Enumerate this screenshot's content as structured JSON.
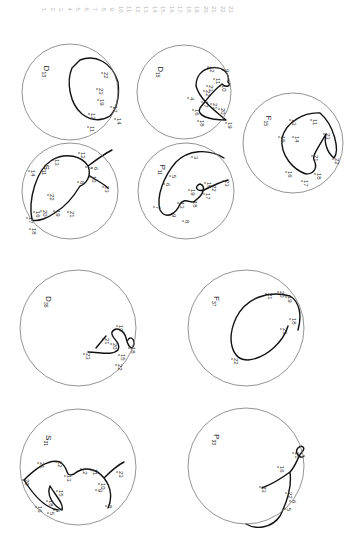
{
  "hour_list": [
    "1.",
    "2.",
    "3.",
    "4.",
    "5.",
    "6.",
    "7.",
    "8.",
    "9.",
    "10.",
    "11.",
    "12.",
    "13.",
    "14.",
    "15.",
    "16.",
    "17.",
    "18.",
    "19.",
    "20.",
    "21.",
    "22.",
    "23."
  ],
  "plots": [
    {
      "id": "D13",
      "letter": "D",
      "sub": "13",
      "cx": 70,
      "cy": 92,
      "r": 48,
      "labels": [
        {
          "t": "11",
          "x": 90,
          "y": 126
        },
        {
          "t": "12",
          "x": 91,
          "y": 113
        },
        {
          "t": "14",
          "x": 117,
          "y": 118
        },
        {
          "t": "17",
          "x": 113,
          "y": 106
        },
        {
          "t": "19",
          "x": 100,
          "y": 99
        },
        {
          "t": "22",
          "x": 104,
          "y": 72
        },
        {
          "t": "23",
          "x": 99,
          "y": 88
        }
      ]
    },
    {
      "id": "D15",
      "letter": "D",
      "sub": "15",
      "cx": 184,
      "cy": 92,
      "r": 47,
      "labels": [
        {
          "t": "4",
          "x": 190,
          "y": 97
        },
        {
          "t": "9",
          "x": 225,
          "y": 69
        },
        {
          "t": "10",
          "x": 222,
          "y": 85
        },
        {
          "t": "11",
          "x": 216,
          "y": 78
        },
        {
          "t": "12",
          "x": 210,
          "y": 66
        },
        {
          "t": "16",
          "x": 195,
          "y": 109
        },
        {
          "t": "17",
          "x": 204,
          "y": 101
        },
        {
          "t": "18",
          "x": 200,
          "y": 120
        },
        {
          "t": "19",
          "x": 228,
          "y": 122
        },
        {
          "t": "20",
          "x": 221,
          "y": 108
        },
        {
          "t": "21",
          "x": 213,
          "y": 103
        },
        {
          "t": "22",
          "x": 206,
          "y": 90
        },
        {
          "t": "23",
          "x": 209,
          "y": 85
        }
      ]
    },
    {
      "id": "F15",
      "letter": "F",
      "sub": "15",
      "cx": 293,
      "cy": 143,
      "r": 50,
      "labels": [
        {
          "t": "11",
          "x": 313,
          "y": 119
        },
        {
          "t": "13",
          "x": 292,
          "y": 119
        },
        {
          "t": "14",
          "x": 295,
          "y": 136
        },
        {
          "t": "15",
          "x": 281,
          "y": 136
        },
        {
          "t": "16",
          "x": 288,
          "y": 171
        },
        {
          "t": "17",
          "x": 304,
          "y": 180
        },
        {
          "t": "18",
          "x": 317,
          "y": 173
        },
        {
          "t": "21",
          "x": 314,
          "y": 155
        },
        {
          "t": "22",
          "x": 335,
          "y": 158
        },
        {
          "t": "23",
          "x": 326,
          "y": 133
        }
      ]
    },
    {
      "id": "S11",
      "letter": "S",
      "sub": "11",
      "cx": 70,
      "cy": 191,
      "r": 48,
      "labels": [
        {
          "t": "6",
          "x": 94,
          "y": 167
        },
        {
          "t": "7",
          "x": 88,
          "y": 166
        },
        {
          "t": "8",
          "x": 80,
          "y": 181
        },
        {
          "t": "10",
          "x": 92,
          "y": 176
        },
        {
          "t": "12",
          "x": 81,
          "y": 152
        },
        {
          "t": "13",
          "x": 55,
          "y": 159
        },
        {
          "t": "14",
          "x": 31,
          "y": 170
        },
        {
          "t": "16",
          "x": 36,
          "y": 211
        },
        {
          "t": "17",
          "x": 29,
          "y": 217
        },
        {
          "t": "18",
          "x": 32,
          "y": 228
        },
        {
          "t": "19",
          "x": 56,
          "y": 210
        },
        {
          "t": "20",
          "x": 43,
          "y": 210
        },
        {
          "t": "21",
          "x": 70,
          "y": 211
        },
        {
          "t": "22",
          "x": 50,
          "y": 194
        },
        {
          "t": "23",
          "x": 105,
          "y": 186
        }
      ]
    },
    {
      "id": "P11",
      "letter": "P",
      "sub": "11",
      "cx": 186,
      "cy": 191,
      "r": 48,
      "labels": [
        {
          "t": "3",
          "x": 194,
          "y": 156
        },
        {
          "t": "5",
          "x": 172,
          "y": 175
        },
        {
          "t": "6",
          "x": 166,
          "y": 183
        },
        {
          "t": "7",
          "x": 156,
          "y": 206
        },
        {
          "t": "8",
          "x": 185,
          "y": 220
        },
        {
          "t": "9",
          "x": 172,
          "y": 214
        },
        {
          "t": "13",
          "x": 180,
          "y": 202
        },
        {
          "t": "16",
          "x": 207,
          "y": 182
        },
        {
          "t": "17",
          "x": 206,
          "y": 193
        },
        {
          "t": "18",
          "x": 193,
          "y": 201
        },
        {
          "t": "19",
          "x": 191,
          "y": 189
        },
        {
          "t": "22",
          "x": 212,
          "y": 185
        },
        {
          "t": "23",
          "x": 225,
          "y": 180
        }
      ]
    },
    {
      "id": "D35",
      "letter": "D",
      "sub": "35",
      "cx": 78,
      "cy": 328,
      "r": 58,
      "labels": [
        {
          "t": "15",
          "x": 121,
          "y": 354
        },
        {
          "t": "18",
          "x": 131,
          "y": 347
        },
        {
          "t": "19",
          "x": 119,
          "y": 325
        },
        {
          "t": "20",
          "x": 113,
          "y": 343
        },
        {
          "t": "21",
          "x": 105,
          "y": 338
        },
        {
          "t": "22",
          "x": 118,
          "y": 364
        },
        {
          "t": "23",
          "x": 86,
          "y": 353
        }
      ]
    },
    {
      "id": "F37",
      "letter": "F",
      "sub": "37",
      "cx": 246,
      "cy": 328,
      "r": 58,
      "labels": [
        {
          "t": "18",
          "x": 292,
          "y": 318
        },
        {
          "t": "19",
          "x": 288,
          "y": 296
        },
        {
          "t": "20",
          "x": 280,
          "y": 291
        },
        {
          "t": "21",
          "x": 268,
          "y": 293
        },
        {
          "t": "22",
          "x": 234,
          "y": 358
        },
        {
          "t": "23",
          "x": 283,
          "y": 328
        }
      ]
    },
    {
      "id": "S31",
      "letter": "S",
      "sub": "31",
      "cx": 78,
      "cy": 467,
      "r": 58,
      "labels": [
        {
          "t": "5",
          "x": 50,
          "y": 512
        },
        {
          "t": "6",
          "x": 56,
          "y": 509
        },
        {
          "t": "8",
          "x": 108,
          "y": 505
        },
        {
          "t": "9",
          "x": 98,
          "y": 489
        },
        {
          "t": "10",
          "x": 101,
          "y": 483
        },
        {
          "t": "11",
          "x": 93,
          "y": 469
        },
        {
          "t": "12",
          "x": 83,
          "y": 468
        },
        {
          "t": "13",
          "x": 67,
          "y": 475
        },
        {
          "t": "15",
          "x": 59,
          "y": 490
        },
        {
          "t": "16",
          "x": 38,
          "y": 506
        },
        {
          "t": "18",
          "x": 49,
          "y": 500
        },
        {
          "t": "20",
          "x": 25,
          "y": 479
        },
        {
          "t": "21",
          "x": 40,
          "y": 462
        },
        {
          "t": "22",
          "x": 58,
          "y": 461
        },
        {
          "t": "23",
          "x": 119,
          "y": 471
        }
      ]
    },
    {
      "id": "P33",
      "letter": "P",
      "sub": "33",
      "cx": 246,
      "cy": 466,
      "r": 58,
      "labels": [
        {
          "t": "5",
          "x": 287,
          "y": 508
        },
        {
          "t": "6",
          "x": 292,
          "y": 500
        },
        {
          "t": "16",
          "x": 280,
          "y": 466
        },
        {
          "t": "21",
          "x": 295,
          "y": 452
        },
        {
          "t": "22",
          "x": 288,
          "y": 492
        },
        {
          "t": "23",
          "x": 262,
          "y": 486
        }
      ]
    }
  ]
}
